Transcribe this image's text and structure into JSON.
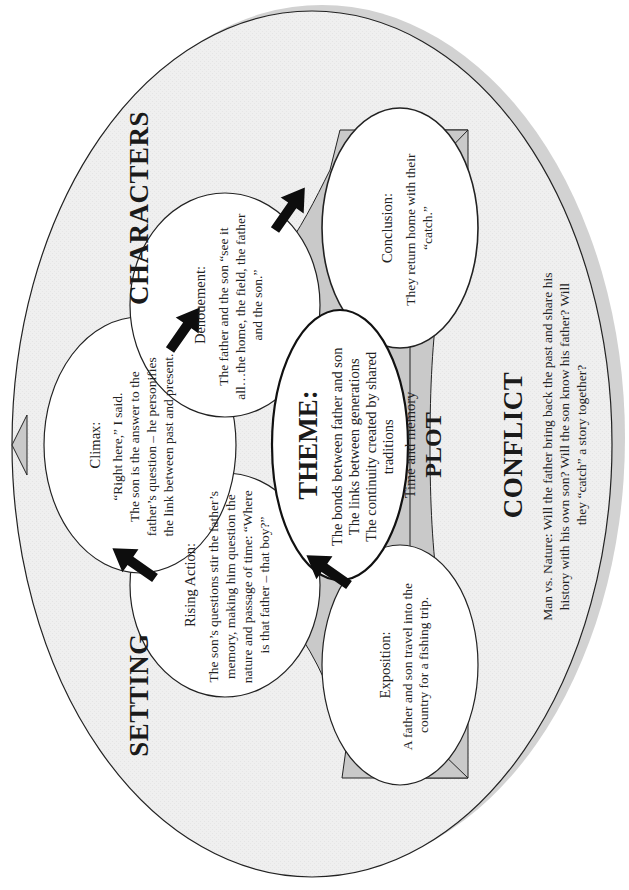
{
  "diagram": {
    "orientation": "rotated -90deg",
    "colors": {
      "outer_fill": "#efefef",
      "outer_shadow": "#d2d2d2",
      "band_fill": "#c9c9c9",
      "node_fill": "#ffffff",
      "stroke": "#222222",
      "arrow": "#0d0d0d"
    },
    "labels": {
      "setting": "SETTING",
      "characters": "CHARACTERS",
      "plot": "PLOT",
      "conflict": "CONFLICT"
    },
    "theme": {
      "title": "THEME:",
      "lines": [
        "The bonds between father and son",
        "The links between generations",
        "The continuity created by shared",
        "traditions",
        "Time and memory"
      ]
    },
    "nodes": {
      "exposition": {
        "title": "Exposition:",
        "lines": [
          "A father and son travel into the",
          "country for a fishing trip."
        ]
      },
      "rising_action": {
        "title": "Rising Action:",
        "lines": [
          "The son’s questions stir the father’s",
          "memory, making him question the",
          "nature and passage of time: “Where",
          "is that father – that boy?”"
        ]
      },
      "climax": {
        "title": "Climax:",
        "lines": [
          "“Right here,” I said.",
          "The son is the answer to the",
          "father’s question – he personifies",
          "the link between past and present."
        ]
      },
      "denouement": {
        "title": "Denouement:",
        "lines": [
          "The father and the son “see it",
          "all…the home, the field, the father",
          "and the son.”"
        ]
      },
      "conclusion": {
        "title": "Conclusion:",
        "lines": [
          "They return home with their",
          "“catch.”"
        ]
      }
    },
    "conflict": {
      "lines": [
        "Man vs. Nature: Will the father bring back the past and share his",
        "history with his own son?  Will the son know his father?  Will",
        "they “catch” a story together?"
      ]
    },
    "arrows": [
      {
        "from": "exposition",
        "to": "rising_action",
        "icon": "arrow-icon"
      },
      {
        "from": "rising_action",
        "to": "climax",
        "icon": "arrow-icon"
      },
      {
        "from": "climax",
        "to": "denouement",
        "icon": "arrow-icon"
      },
      {
        "from": "denouement",
        "to": "conclusion",
        "icon": "arrow-icon"
      }
    ]
  }
}
